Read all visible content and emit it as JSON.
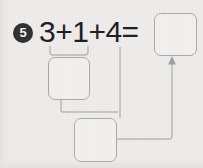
{
  "worksheet": {
    "width": 203,
    "height": 168,
    "background_color": "#edeceb",
    "ink_color": "#1d1d1d",
    "box_stroke_color": "#a9a9a9",
    "connector_color": "#b0b0b0",
    "badge_fill_color": "#2f2f2f",
    "badge_text_color": "#f2f2f2"
  },
  "problem": {
    "number": "5",
    "equation": "3+1+4=",
    "operands": [
      "3",
      "1",
      "4"
    ],
    "operators": [
      "+",
      "+"
    ],
    "equals": "="
  },
  "boxes": {
    "answer": {
      "label": "",
      "x": 154,
      "y": 13,
      "w": 43,
      "h": 43
    },
    "partial_sum_1": {
      "label": "",
      "x": 48,
      "y": 57,
      "w": 42,
      "h": 43
    },
    "partial_sum_2": {
      "label": "",
      "x": 74,
      "y": 118,
      "w": 43,
      "h": 44
    }
  },
  "connectors": {
    "bracket_3_plus_1": "bracket under 3+1 joining into first partial-sum box",
    "partial1_to_partial2": "elbow from bottom of first partial box down into second partial box",
    "four_to_partial2": "vertical line from the 4 down into the second partial box",
    "partial2_to_answer": "elbow from right of second partial box across and up, arrow into answer box"
  }
}
